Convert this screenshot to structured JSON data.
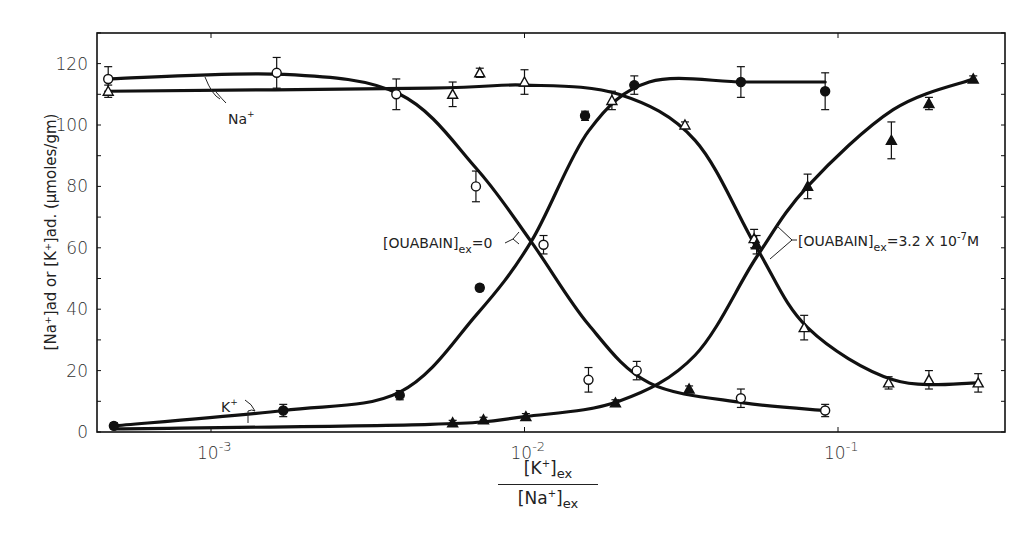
{
  "chart_data": {
    "type": "scatter",
    "title": "",
    "xlabel": "[K+]ex / [Na+]ex",
    "ylabel": "[Na+]ad or [K+]ad. (µmoles/gm)",
    "xscale": "log",
    "xlim": [
      0.00042,
      0.3
    ],
    "ylim": [
      0,
      130
    ],
    "grid": false,
    "x_tick_labels": [
      "10-3",
      "10-2",
      "10-1"
    ],
    "x_ticks": [
      0.001,
      0.01,
      0.1
    ],
    "y_tick_labels": [
      "0",
      "20",
      "40",
      "60",
      "80",
      "100",
      "120"
    ],
    "y_ticks": [
      0,
      20,
      40,
      60,
      80,
      100,
      120
    ],
    "series": [
      {
        "name": "Na+ , [OUABAIN]ex = 0",
        "marker": "open-circle",
        "x": [
          0.00047,
          0.00162,
          0.0039,
          0.007,
          0.0115,
          0.016,
          0.0228,
          0.049,
          0.091
        ],
        "y": [
          115,
          117,
          110,
          80,
          61,
          17,
          20,
          11,
          7
        ],
        "err": [
          4,
          5,
          5,
          5,
          3,
          4,
          3,
          3,
          2
        ]
      },
      {
        "name": "Na+ , [OUABAIN]ex = 3.2 x 10-7 M",
        "marker": "open-triangle",
        "x": [
          0.00047,
          0.0059,
          0.0072,
          0.01,
          0.019,
          0.0325,
          0.054,
          0.078,
          0.145,
          0.195,
          0.28
        ],
        "y": [
          111,
          110,
          117,
          114,
          108,
          100,
          63,
          34,
          16,
          17,
          16
        ],
        "err": [
          2,
          4,
          1.5,
          4,
          3,
          1,
          3,
          4,
          2,
          3,
          3
        ]
      },
      {
        "name": "K+ , [OUABAIN]ex = 0",
        "marker": "filled-circle",
        "x": [
          0.00049,
          0.0017,
          0.004,
          0.0072,
          0.0156,
          0.0224,
          0.049,
          0.091
        ],
        "y": [
          2,
          7,
          12,
          47,
          103,
          113,
          114,
          111
        ],
        "err": [
          1,
          2,
          1.5,
          1,
          1.5,
          3,
          5,
          6
        ]
      },
      {
        "name": "K+ , [OUABAIN]ex = 3.2 x 10-7 M",
        "marker": "filled-triangle",
        "x": [
          0.0059,
          0.0074,
          0.0101,
          0.0195,
          0.0335,
          0.055,
          0.08,
          0.148,
          0.195,
          0.27
        ],
        "y": [
          3,
          4,
          5,
          9.5,
          14,
          61,
          80,
          95,
          107,
          115
        ],
        "err": [
          0.8,
          0.8,
          1,
          1,
          1,
          3,
          4,
          6,
          2,
          1
        ]
      }
    ],
    "fitted_curves": [
      {
        "name": "Na+ fit (ouabain 0)",
        "x": [
          0.00047,
          0.0017,
          0.004,
          0.007,
          0.0105,
          0.016,
          0.025,
          0.05,
          0.091
        ],
        "y": [
          115,
          116.5,
          110,
          86,
          62,
          35,
          16,
          9.5,
          7
        ]
      },
      {
        "name": "Na+ fit (ouabain 3.2e-7)",
        "x": [
          0.00047,
          0.005,
          0.01,
          0.02,
          0.035,
          0.055,
          0.08,
          0.15,
          0.28
        ],
        "y": [
          111,
          112,
          113,
          110,
          95,
          60,
          34,
          17,
          16
        ]
      },
      {
        "name": "K+ fit (ouabain 0)",
        "x": [
          0.00049,
          0.0017,
          0.004,
          0.007,
          0.0105,
          0.016,
          0.025,
          0.05,
          0.091
        ],
        "y": [
          2,
          7,
          13,
          38,
          62,
          98,
          114,
          114,
          114
        ]
      },
      {
        "name": "K+ fit (ouabain 3.2e-7)",
        "x": [
          0.00049,
          0.005,
          0.01,
          0.02,
          0.035,
          0.055,
          0.08,
          0.15,
          0.27
        ],
        "y": [
          1,
          2.5,
          5,
          10,
          25,
          57,
          80,
          105,
          115
        ]
      }
    ],
    "annotations": [
      {
        "text": "Na+",
        "target": "upper Na+ curves (left)"
      },
      {
        "text": "K+",
        "target": "lower K+ curves (left)"
      },
      {
        "text": "[OUABAIN]ex = 0",
        "target": "left crossover"
      },
      {
        "text": "[OUABAIN]ex = 3.2 X 10-7 M",
        "target": "right crossover"
      }
    ]
  },
  "labels": {
    "y_axis": "[Na⁺]ad or [K⁺]ad. (µmoles/gm)",
    "x_num_main": "[K",
    "x_num_sup": "+",
    "x_num_close": "]",
    "x_num_sub": "ex",
    "x_den_main": "[Na",
    "x_den_sup": "+",
    "x_den_close": "]",
    "x_den_sub": "ex",
    "na_label": "Na",
    "k_label": "K",
    "ion_sup": "+",
    "ouabain_zero_main": "[OUABAIN]",
    "ouabain_zero_sub": "ex",
    "ouabain_zero_val": "=0",
    "ouabain_high_main": "[OUABAIN]",
    "ouabain_high_sub": "ex",
    "ouabain_high_val": "=3.2 X 10",
    "ouabain_high_exp": "-7",
    "ouabain_high_unit": "M"
  }
}
